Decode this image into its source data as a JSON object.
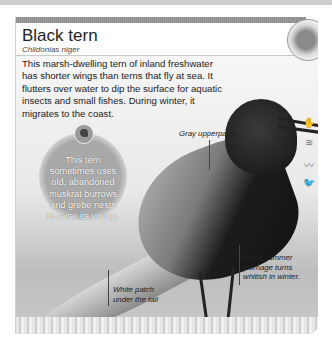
{
  "page": {
    "title": "Black tern",
    "scientific_name": "Chlidonias niger",
    "description": "This marsh-dwelling tern of inland freshwater has shorter wings than terns that fly at sea. It flutters over water to dip the surface for aquatic insects and small fishes. During winter, it migrates to the coast.",
    "fact_bubble": "This tern sometimes uses old, abandoned muskrat burrows and grebe nests to raise its young.",
    "labels": {
      "upperparts": "Gray upperparts",
      "summer_plumage": "Black summer plumage turns whitish in winter.",
      "tail_patch": "White patch under the tail"
    },
    "habitat_icons": [
      "hand-icon",
      "waves-icon",
      "reeds-icon",
      "bird-icon",
      "hand-icon"
    ],
    "range_map": "north-america-range-map"
  }
}
